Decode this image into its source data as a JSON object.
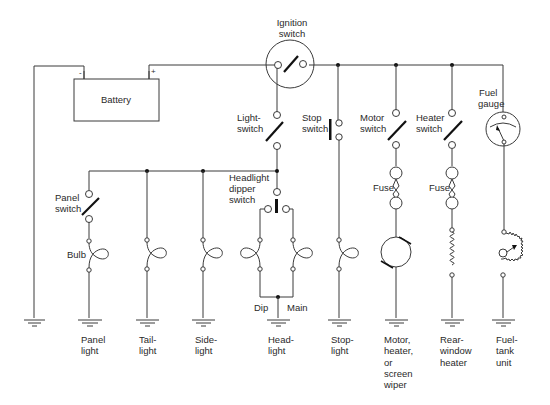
{
  "diagram": {
    "title": "",
    "components": {
      "battery": {
        "label": "Battery",
        "neg": "-",
        "pos": "+"
      },
      "ignition_switch": {
        "label_line1": "Ignition",
        "label_line2": "switch"
      },
      "light_switch": {
        "label_line1": "Light-",
        "label_line2": "switch"
      },
      "stop_switch": {
        "label_line1": "Stop",
        "label_line2": "switch"
      },
      "motor_switch": {
        "label_line1": "Motor",
        "label_line2": "switch"
      },
      "heater_switch": {
        "label_line1": "Heater",
        "label_line2": "switch"
      },
      "fuel_gauge": {
        "label_line1": "Fuel",
        "label_line2": "gauge"
      },
      "panel_switch": {
        "label_line1": "Panel",
        "label_line2": "switch"
      },
      "headlight_dipper_switch": {
        "label_line1": "Headlight",
        "label_line2": "dipper",
        "label_line3": "switch"
      },
      "bulb": {
        "label": "Bulb"
      },
      "fuse_motor": {
        "label": "Fuse"
      },
      "fuse_heater": {
        "label": "Fuse"
      },
      "dip": {
        "label": "Dip"
      },
      "main": {
        "label": "Main"
      }
    },
    "loads": [
      {
        "id": "panel-light",
        "lines": [
          "Panel",
          "light"
        ]
      },
      {
        "id": "tail-light",
        "lines": [
          "Tail-",
          "light"
        ]
      },
      {
        "id": "side-light",
        "lines": [
          "Side-",
          "light"
        ]
      },
      {
        "id": "head-light",
        "lines": [
          "Head-",
          "light"
        ]
      },
      {
        "id": "stop-light",
        "lines": [
          "Stop-",
          "light"
        ]
      },
      {
        "id": "motor",
        "lines": [
          "Motor,",
          "heater,",
          "or",
          "screen",
          "wiper"
        ]
      },
      {
        "id": "rear-window-heater",
        "lines": [
          "Rear-",
          "window",
          "heater"
        ]
      },
      {
        "id": "fuel-tank-unit",
        "lines": [
          "Fuel-",
          "tank",
          "unit"
        ]
      }
    ]
  }
}
